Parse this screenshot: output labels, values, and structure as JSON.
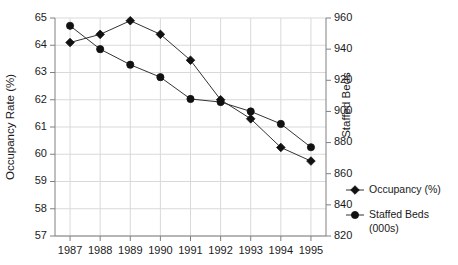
{
  "chart_data": {
    "type": "line",
    "title": "",
    "xlabel": "",
    "ylabel": "Occupancy Rate (%)",
    "y2label": "Staffed Beds",
    "grid": true,
    "legend_position": "right",
    "categories": [
      "1987",
      "1988",
      "1989",
      "1990",
      "1991",
      "1992",
      "1993",
      "1994",
      "1995"
    ],
    "x": [
      1987,
      1988,
      1989,
      1990,
      1991,
      1992,
      1993,
      1994,
      1995
    ],
    "ylim": [
      57,
      65
    ],
    "yticks": [
      57,
      58,
      59,
      60,
      61,
      62,
      63,
      64,
      65
    ],
    "y2lim": [
      820,
      960
    ],
    "y2ticks": [
      820,
      840,
      860,
      880,
      900,
      920,
      940,
      960
    ],
    "series": [
      {
        "name": "Occupancy (%)",
        "axis": "left",
        "marker": "diamond",
        "color": "#111111",
        "values": [
          64.1,
          64.4,
          64.9,
          64.4,
          63.45,
          62.0,
          61.3,
          60.25,
          59.75
        ]
      },
      {
        "name": "Staffed Beds (000s)",
        "axis": "right",
        "marker": "circle",
        "color": "#111111",
        "values": [
          955,
          940,
          930,
          922,
          908,
          906,
          900,
          892,
          877
        ]
      }
    ]
  },
  "axes": {
    "left": {
      "title": "Occupancy Rate (%)",
      "tick_labels": [
        "65",
        "64",
        "63",
        "62",
        "61",
        "60",
        "59",
        "58",
        "57"
      ]
    },
    "right": {
      "title": "Staffed Beds",
      "tick_labels": [
        "960",
        "940",
        "920",
        "900",
        "880",
        "860",
        "840",
        "820"
      ]
    },
    "bottom": {
      "tick_labels": [
        "1987",
        "1988",
        "1989",
        "1990",
        "1991",
        "1992",
        "1993",
        "1994",
        "1995"
      ]
    }
  },
  "legend": {
    "items": [
      {
        "label": "Occupancy (%)",
        "marker": "diamond-marker"
      },
      {
        "label": "Staffed Beds",
        "label2": "(000s)",
        "marker": "circle-marker"
      }
    ]
  }
}
